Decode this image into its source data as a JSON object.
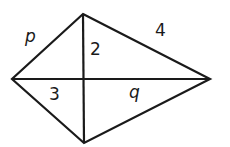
{
  "diagram": {
    "type": "kite with diagonals",
    "vertices": {
      "top": [
        83,
        14
      ],
      "left": [
        12,
        79
      ],
      "right": [
        210,
        79
      ],
      "bottom": [
        84,
        143
      ],
      "intersection": [
        83,
        79
      ]
    },
    "labels": {
      "p": "p",
      "four": "4",
      "two": "2",
      "three": "3",
      "q": "q"
    },
    "stroke_color": "#1a1a1a"
  }
}
